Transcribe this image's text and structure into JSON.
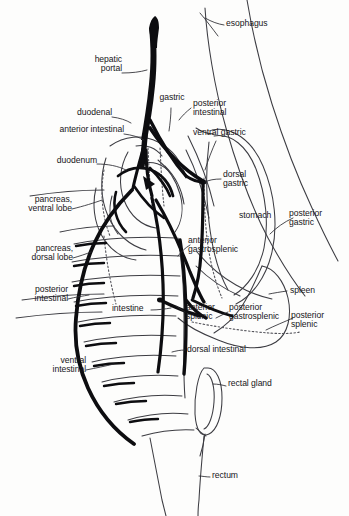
{
  "figure": {
    "style": "black ink line drawing on white",
    "colors": {
      "background": "#fdfdfc",
      "ink": "#17161a",
      "vessel_fill": "#0d0d10",
      "thin_line": "#4a4a50",
      "dotted_line": "#5a5a60"
    }
  },
  "labels": {
    "esophagus": "esophagus",
    "hepatic_portal": "hepatic\nportal",
    "gastric": "gastric",
    "posterior_intestinal_top": "posterior\nintestinal",
    "ventral_gastric": "ventral gastric",
    "duodenal": "duodenal",
    "anterior_intestinal": "anterior intestinal",
    "duodenum": "duodenum",
    "dorsal_gastric": "dorsal\ngastric",
    "pancreas_ventral": "pancreas,\nventral lobe",
    "stomach": "stomach",
    "posterior_gastric": "posterior\ngastric",
    "pancreas_dorsal": "pancreas,\ndorsal lobe",
    "anterior_gastrosplenic": "anterior\ngastrosplenic",
    "posterior_intestinal_left": "posterior\nintestinal",
    "spleen": "spleen",
    "intestine": "intestine",
    "anterior_splenic": "anterior\nsplenic",
    "posterior_gastrosplenic": "posterior\ngastrosplenic",
    "posterior_splenic": "posterior\nsplenic",
    "ventral_intestinal": "ventral\nintestinal",
    "dorsal_intestinal": "dorsal intestinal",
    "rectal_gland": "rectal gland",
    "rectum": "rectum"
  }
}
